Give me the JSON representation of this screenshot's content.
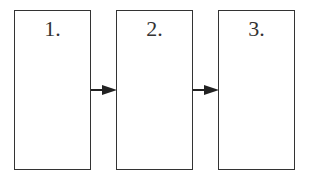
{
  "diagram": {
    "type": "flow",
    "steps": [
      {
        "label": "1."
      },
      {
        "label": "2."
      },
      {
        "label": "3."
      }
    ],
    "connections": [
      {
        "from": 0,
        "to": 1
      },
      {
        "from": 1,
        "to": 2
      }
    ],
    "colors": {
      "stroke": "#333333",
      "background": "#ffffff"
    }
  }
}
